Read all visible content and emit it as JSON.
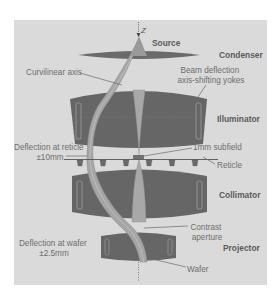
{
  "figure": {
    "axis_label": "Z",
    "components": {
      "source": "Source",
      "condenser": "Condenser",
      "illuminator": "Illuminator",
      "collimator": "Collimator",
      "projector": "Projector"
    },
    "annotations": {
      "curvilinear_axis": "Curvilinear axis",
      "beam_deflection_line1": "Beam deflection",
      "beam_deflection_line2": "axis-shifting yokes",
      "deflection_reticle_line1": "Deflection at reticle",
      "deflection_reticle_line2": "±10mm",
      "subfield": "1mm subfield",
      "reticle": "Reticle",
      "contrast_line1": "Contrast",
      "contrast_line2": "aperture",
      "deflection_wafer_line1": "Deflection at wafer",
      "deflection_wafer_line2": "±2.5mm",
      "wafer": "Wafer"
    },
    "colors": {
      "panel": "#dadada",
      "lens": "#666666",
      "lens_edge": "#808080",
      "beam": "#a9a9a9",
      "beam_edge": "#8a8a8a",
      "axis": "#4a4a4a"
    }
  }
}
